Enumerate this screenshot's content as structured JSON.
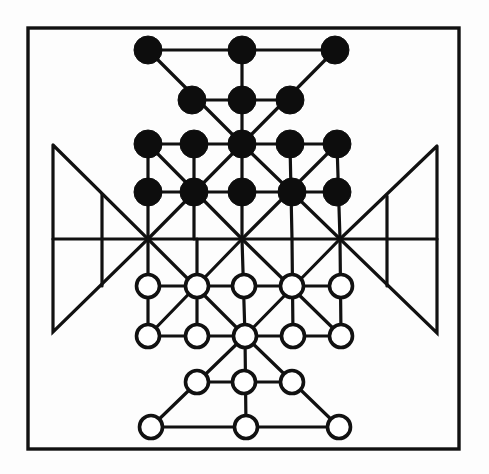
{
  "board": {
    "title": "",
    "colors": {
      "background": "#fdfdfd",
      "line": "#111111",
      "black_piece": "#0d0d0d",
      "white_piece": "#ffffff"
    },
    "frame": {
      "x1": 28,
      "y1": 28,
      "x2": 459,
      "y2": 449
    },
    "pieces": {
      "black": [
        {
          "x": 148,
          "y": 50
        },
        {
          "x": 242,
          "y": 50
        },
        {
          "x": 335,
          "y": 50
        },
        {
          "x": 192,
          "y": 100
        },
        {
          "x": 242,
          "y": 100
        },
        {
          "x": 290,
          "y": 100
        },
        {
          "x": 148,
          "y": 144
        },
        {
          "x": 194,
          "y": 144
        },
        {
          "x": 242,
          "y": 144
        },
        {
          "x": 290,
          "y": 144
        },
        {
          "x": 337,
          "y": 144
        },
        {
          "x": 148,
          "y": 192
        },
        {
          "x": 194,
          "y": 192
        },
        {
          "x": 242,
          "y": 192
        },
        {
          "x": 292,
          "y": 192
        },
        {
          "x": 337,
          "y": 192
        }
      ],
      "white": [
        {
          "x": 148,
          "y": 286
        },
        {
          "x": 197,
          "y": 286
        },
        {
          "x": 244,
          "y": 286
        },
        {
          "x": 292,
          "y": 286
        },
        {
          "x": 341,
          "y": 286
        },
        {
          "x": 148,
          "y": 336
        },
        {
          "x": 197,
          "y": 336
        },
        {
          "x": 245,
          "y": 336
        },
        {
          "x": 293,
          "y": 336
        },
        {
          "x": 341,
          "y": 336
        },
        {
          "x": 197,
          "y": 382
        },
        {
          "x": 244,
          "y": 382
        },
        {
          "x": 292,
          "y": 382
        },
        {
          "x": 151,
          "y": 427
        },
        {
          "x": 246,
          "y": 427
        },
        {
          "x": 339,
          "y": 427
        }
      ],
      "black_count": 16,
      "white_count": 16,
      "radius_black": 14,
      "radius_white": 11.5
    }
  }
}
